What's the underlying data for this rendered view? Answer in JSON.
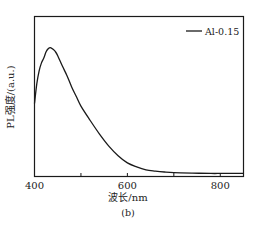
{
  "chart_data": {
    "type": "line",
    "title": "",
    "caption": "(b)",
    "xlabel": "波长/nm",
    "ylabel": "PL强度/(a.u.)",
    "xlim": [
      400,
      850
    ],
    "ylim": [
      0,
      100
    ],
    "x_ticks": [
      400,
      600,
      800
    ],
    "x_minor_ticks": [
      500,
      700
    ],
    "y_ticks": [],
    "grid": false,
    "legend_position": "upper right",
    "series": [
      {
        "name": "Al-0.15",
        "color": "#1a1a1a",
        "x": [
          400,
          405,
          410,
          415,
          420,
          425,
          430,
          434,
          440,
          445,
          450,
          460,
          470,
          480,
          490,
          500,
          520,
          540,
          560,
          580,
          600,
          620,
          640,
          660,
          680,
          700,
          740,
          780,
          800,
          820,
          850
        ],
        "values": [
          45.6,
          58,
          66,
          71,
          74,
          78,
          80,
          80.6,
          79.5,
          78,
          75.5,
          69,
          63,
          56,
          50,
          44,
          35,
          26.5,
          19,
          13,
          8.5,
          6,
          4.2,
          3.4,
          2.8,
          2.4,
          2.1,
          1.9,
          1.9,
          1.9,
          1.9
        ]
      }
    ]
  },
  "legend": {
    "label": "Al-0.15"
  },
  "axes": {
    "x_tick_labels": [
      "400",
      "600",
      "800"
    ],
    "xlabel": "波长/nm",
    "ylabel": "PL强度/(a.u.)"
  },
  "figure": {
    "caption": "(b)"
  }
}
